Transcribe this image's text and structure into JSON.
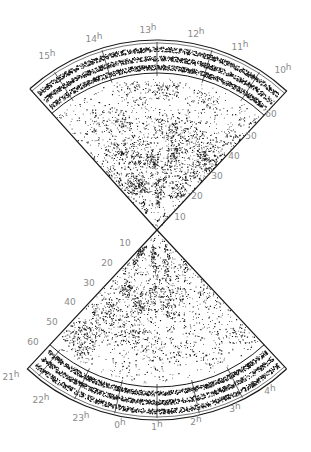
{
  "figure": {
    "type": "redshift-survey-cone-diagram",
    "background": "#ffffff",
    "ink_color": "#1a1a1a",
    "label_color": "#8a8a8a",
    "apex": [
      157,
      230
    ],
    "outer_radius": 190,
    "strip_inner_radius": 157
  },
  "upper_wedge": {
    "angle_start_deg": -42,
    "angle_end_deg": 43,
    "ra_labels": [
      {
        "text": "15",
        "unit": "h",
        "x": 47,
        "y": 59
      },
      {
        "text": "14",
        "unit": "h",
        "x": 94,
        "y": 42
      },
      {
        "text": "13",
        "unit": "h",
        "x": 148,
        "y": 33
      },
      {
        "text": "12",
        "unit": "h",
        "x": 196,
        "y": 37
      },
      {
        "text": "11",
        "unit": "h",
        "x": 240,
        "y": 50
      },
      {
        "text": "10",
        "unit": "h",
        "x": 283,
        "y": 73
      }
    ],
    "ra_tick_angles_deg": [
      -33,
      -17,
      0,
      17,
      33
    ],
    "distance_labels": [
      {
        "text": "60",
        "x": 271,
        "y": 117
      },
      {
        "text": "50",
        "x": 251,
        "y": 139
      },
      {
        "text": "40",
        "x": 234,
        "y": 159
      },
      {
        "text": "30",
        "x": 217,
        "y": 179
      },
      {
        "text": "20",
        "x": 197,
        "y": 199
      },
      {
        "text": "10",
        "x": 180,
        "y": 220
      }
    ]
  },
  "lower_wedge": {
    "angle_start_deg": 137,
    "angle_end_deg": 223,
    "ra_labels": [
      {
        "text": "21",
        "unit": "h",
        "x": 11,
        "y": 380
      },
      {
        "text": "22",
        "unit": "h",
        "x": 41,
        "y": 403
      },
      {
        "text": "23",
        "unit": "h",
        "x": 81,
        "y": 421
      },
      {
        "text": "0",
        "unit": "h",
        "x": 120,
        "y": 428
      },
      {
        "text": "1",
        "unit": "h",
        "x": 157,
        "y": 430
      },
      {
        "text": "2",
        "unit": "h",
        "x": 196,
        "y": 425
      },
      {
        "text": "3",
        "unit": "h",
        "x": 235,
        "y": 412
      },
      {
        "text": "4",
        "unit": "h",
        "x": 270,
        "y": 394
      }
    ],
    "ra_tick_angles_deg": [
      153,
      167,
      180,
      193,
      206,
      219
    ],
    "distance_labels": [
      {
        "text": "10",
        "x": 125,
        "y": 246
      },
      {
        "text": "20",
        "x": 107,
        "y": 266
      },
      {
        "text": "30",
        "x": 89,
        "y": 286
      },
      {
        "text": "40",
        "x": 70,
        "y": 305
      },
      {
        "text": "50",
        "x": 52,
        "y": 325
      },
      {
        "text": "60",
        "x": 33,
        "y": 345
      }
    ]
  },
  "points": {
    "upper_count": 2600,
    "lower_count": 2200,
    "strip_count_per_band": 900,
    "seed": 1337
  }
}
